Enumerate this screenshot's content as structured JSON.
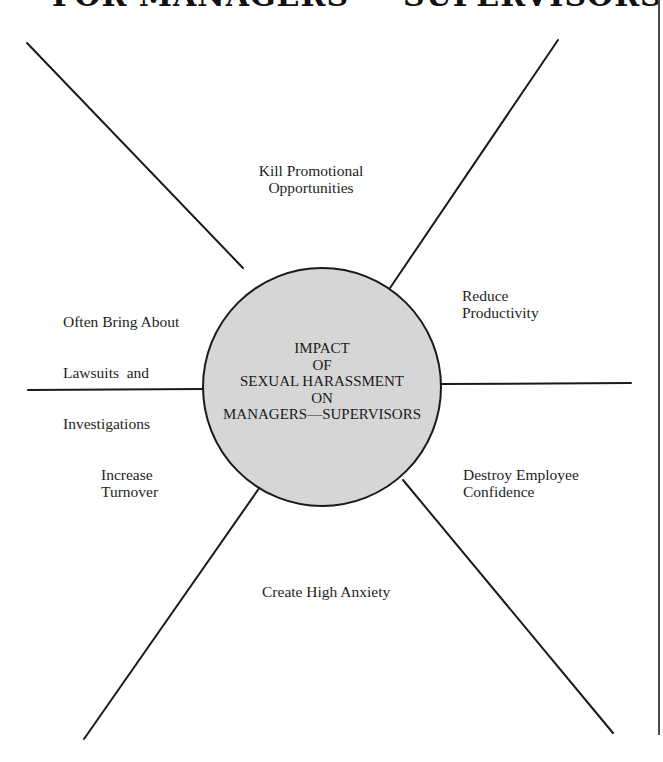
{
  "header": {
    "title": "FOR MANAGERS — SUPERVISORS"
  },
  "diagram": {
    "type": "radial-spoke",
    "center": {
      "lines": [
        "IMPACT",
        "OF",
        "SEXUAL HARASSMENT",
        "ON",
        "MANAGERS—SUPERVISORS"
      ],
      "fill_color": "#d6d6d6",
      "stroke_color": "#1a1a1a"
    },
    "spokes": [
      {
        "position": "top",
        "lines": [
          "Kill Promotional",
          "Opportunities"
        ]
      },
      {
        "position": "upper-left",
        "lines": [
          "Often Bring About",
          "Lawsuits  and",
          "Investigations"
        ]
      },
      {
        "position": "upper-right",
        "lines": [
          "Reduce",
          "Productivity"
        ]
      },
      {
        "position": "lower-left",
        "lines": [
          "Increase",
          "Turnover"
        ]
      },
      {
        "position": "lower-right",
        "lines": [
          "Destroy Employee",
          "Confidence"
        ]
      },
      {
        "position": "bottom",
        "lines": [
          "Create High Anxiety"
        ]
      }
    ],
    "line_color": "#1a1a1a"
  }
}
